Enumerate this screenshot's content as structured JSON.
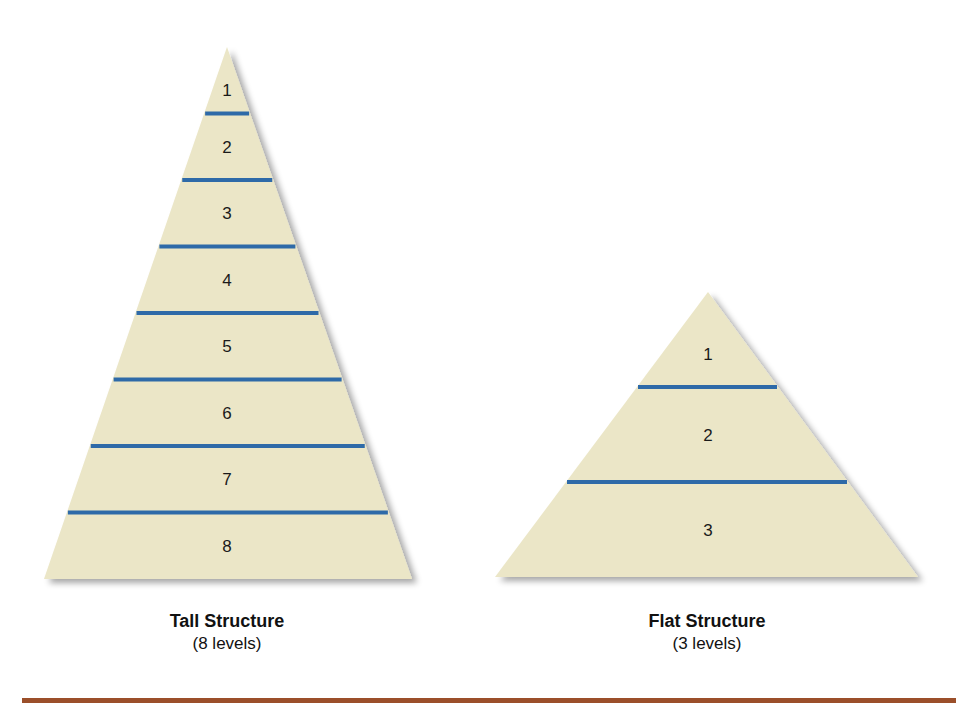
{
  "figure": {
    "tall": {
      "title": "Tall Structure",
      "subtitle": "(8 levels)",
      "levels": [
        "1",
        "2",
        "3",
        "4",
        "5",
        "6",
        "7",
        "8"
      ]
    },
    "flat": {
      "title": "Flat Structure",
      "subtitle": "(3 levels)",
      "levels": [
        "1",
        "2",
        "3"
      ]
    },
    "colors": {
      "fill": "#ebe6c7",
      "divider": "#2e6aa8",
      "rule": "#9b4f2a"
    }
  }
}
